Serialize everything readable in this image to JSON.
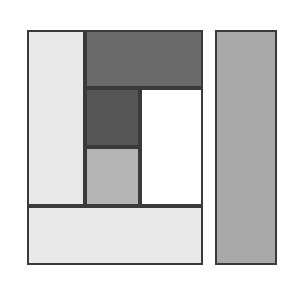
{
  "figure": {
    "background_color": "#ffffff",
    "width": 296,
    "height": 283,
    "stroke_color": "#3a3a3a",
    "stroke_width": 2
  },
  "shapes": [
    {
      "id": "main-box",
      "name": "main-composite-rectangle",
      "label": "",
      "x": 27,
      "y": 30,
      "w": 176,
      "h": 235,
      "fill": "none"
    },
    {
      "id": "left-column",
      "name": "left-light-column",
      "label": "",
      "x": 27,
      "y": 30,
      "w": 58,
      "h": 176,
      "fill": "#e9e9e9"
    },
    {
      "id": "top-band",
      "name": "top-dark-band",
      "label": "",
      "x": 85,
      "y": 30,
      "w": 118,
      "h": 58,
      "fill": "#6a6a6a"
    },
    {
      "id": "inner-square",
      "name": "inner-dark-square",
      "label": "",
      "x": 85,
      "y": 88,
      "w": 55,
      "h": 59,
      "fill": "#565656"
    },
    {
      "id": "mid-gray-block",
      "name": "middle-gray-block",
      "label": "",
      "x": 85,
      "y": 147,
      "w": 55,
      "h": 59,
      "fill": "#b4b4b4"
    },
    {
      "id": "white-block",
      "name": "white-block",
      "label": "",
      "x": 140,
      "y": 88,
      "w": 63,
      "h": 118,
      "fill": "#ffffff"
    },
    {
      "id": "bottom-band",
      "name": "bottom-light-band",
      "label": "",
      "x": 27,
      "y": 206,
      "w": 176,
      "h": 59,
      "fill": "#e9e9e9"
    },
    {
      "id": "right-panel",
      "name": "right-gray-panel",
      "label": "",
      "x": 215,
      "y": 30,
      "w": 62,
      "h": 235,
      "fill": "#a9a9a9"
    }
  ]
}
